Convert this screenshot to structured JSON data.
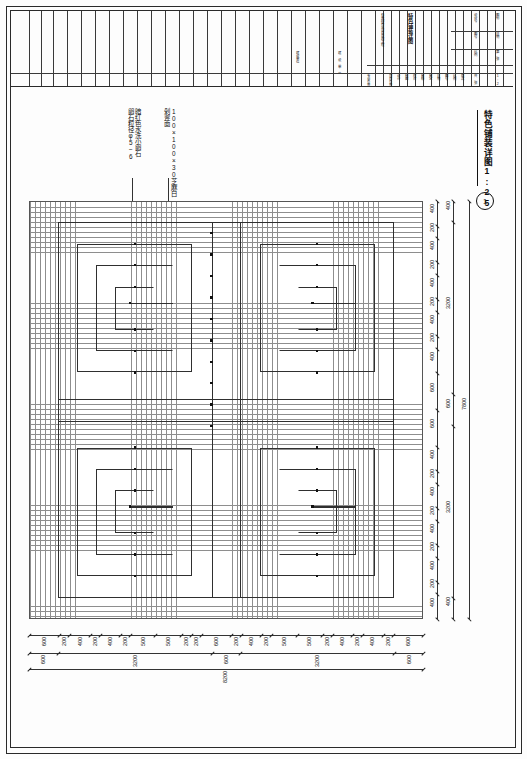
{
  "sheet": {
    "drawing_title": "特色铺装详图",
    "drawing_scale": "1:25",
    "detail_number": "1"
  },
  "titleblock": {
    "project_name": "石墨园商业项目景观工程",
    "drawing_name": "特色铺装详图",
    "design_unit": "建设单位",
    "fields": [
      {
        "label": "专业负责人"
      },
      {
        "label": "项目负责人"
      },
      {
        "label": "设计"
      },
      {
        "label": "制图"
      },
      {
        "label": "校对"
      },
      {
        "label": "审核"
      },
      {
        "label": "审定"
      },
      {
        "label": "日期"
      },
      {
        "label": "图号"
      },
      {
        "label": "比例"
      },
      {
        "label": "版次"
      }
    ],
    "right_cells": [
      {
        "label": "设计号"
      },
      {
        "label": "图别"
      },
      {
        "label": "图号"
      },
      {
        "label": "日期"
      },
      {
        "label": "比例"
      },
      {
        "label": "第 张"
      },
      {
        "label": "共 张"
      }
    ],
    "scale_value": "1:25"
  },
  "annotations": [
    {
      "id": "stone-pebble",
      "text": "暗红色水洗小卵石\n卵石粒径φ5~6"
    },
    {
      "id": "granite-tile",
      "text": "100×100×30芝麻白\n剁斧面"
    }
  ],
  "dimensions": {
    "bottom_chain": [
      600,
      200,
      400,
      200,
      400,
      200,
      500,
      500,
      200,
      200,
      600,
      200,
      400,
      200,
      500,
      500,
      200,
      400,
      200,
      400,
      200,
      600
    ],
    "bottom_mid": [
      600,
      3200,
      600,
      3200,
      600
    ],
    "bottom_total": 8200,
    "right_chain": [
      400,
      200,
      400,
      200,
      400,
      200,
      400,
      200,
      400,
      600,
      600,
      400,
      200,
      400,
      200,
      400,
      200,
      400,
      200,
      400
    ],
    "right_mid": [
      400,
      3200,
      600,
      3200,
      400
    ],
    "right_total": 7800
  },
  "chart_data": {
    "type": "table",
    "note": "Paving plan grid with four meander (回纹) motifs",
    "grid_module_mm": 100,
    "overall_width_mm": 8200,
    "overall_height_mm": 7800,
    "motif_count": 4
  }
}
